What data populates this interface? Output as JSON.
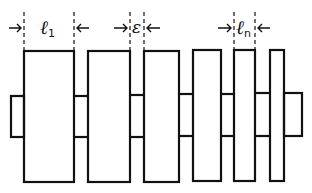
{
  "diagram": {
    "type": "stacked-plates-with-gaps",
    "stroke_color": "#111111",
    "background": "#ffffff",
    "labels": {
      "first_width": {
        "symbol": "ℓ",
        "subscript": "1"
      },
      "gap": {
        "symbol": "ε"
      },
      "last_width": {
        "symbol": "ℓ",
        "subscript": "n"
      }
    },
    "plates": [
      {
        "x": 24,
        "w": 50
      },
      {
        "x": 88,
        "w": 42
      },
      {
        "x": 144,
        "w": 35
      },
      {
        "x": 193,
        "w": 28
      },
      {
        "x": 234,
        "w": 21
      },
      {
        "x": 270,
        "w": 14
      }
    ],
    "left_stub": {
      "x": 11,
      "w": 13
    },
    "right_stub": {
      "x": 284,
      "w": 18
    }
  }
}
